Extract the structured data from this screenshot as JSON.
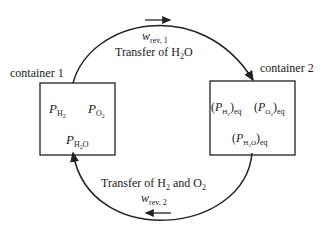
{
  "container1": {
    "label": "container 1",
    "p_h2": "P",
    "p_h2_sub": "H",
    "p_h2_sub2": "2",
    "p_o2": "P",
    "p_o2_sub": "O",
    "p_o2_sub2": "2",
    "p_h2o": "P",
    "p_h2o_sub": "H",
    "p_h2o_sub2": "2",
    "p_h2o_sub3": "O"
  },
  "container2": {
    "label": "container 2",
    "eq": "eq",
    "lparen": "(",
    "rparen": ")"
  },
  "top_arrow": {
    "work_symbol": "w",
    "work_sub": "rev, 1",
    "transfer_text": "Transfer of H",
    "transfer_sub": "2",
    "transfer_tail": "O"
  },
  "bottom_arrow": {
    "transfer_text": "Transfer of H",
    "transfer_sub1": "2",
    "transfer_mid": " and O",
    "transfer_sub2": "2",
    "work_symbol": "w",
    "work_sub": "rev, 2"
  }
}
